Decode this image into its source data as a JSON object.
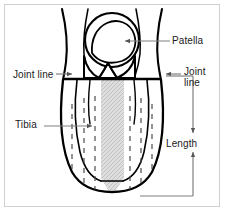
{
  "figure": {
    "type": "anatomical-line-diagram",
    "frame_color": "#cfcfcf",
    "background_color": "#ffffff",
    "line_color": "#000000",
    "leader_color": "#808080",
    "shaded_band_color": "#d6d6d6",
    "dashed_line_color": "#555555"
  },
  "labels": {
    "patella": "Patella",
    "joint_line_left": "Joint line",
    "joint_line_right": "Joint\nline",
    "joint_line_right_l1": "Joint",
    "joint_line_right_l2": "line",
    "tibia": "Tibia",
    "length": "Length"
  },
  "annotations": [
    {
      "name": "patella",
      "text": "Patella",
      "side": "right",
      "leader": "horizontal-line-with-arrow",
      "points_to": "patella-circle"
    },
    {
      "name": "joint-line-left",
      "text": "Joint line",
      "side": "left",
      "leader": "horizontal-line-with-arrow",
      "points_to": "left-knee-joint-margin"
    },
    {
      "name": "joint-line-right",
      "text": "Joint line",
      "side": "right",
      "leader": "horizontal-line-with-arrow",
      "points_to": "right-knee-joint-margin"
    },
    {
      "name": "tibia",
      "text": "Tibia",
      "side": "left",
      "leader": "horizontal-line-with-arrow",
      "points_to": "tibia-shaft"
    },
    {
      "name": "length",
      "text": "Length",
      "side": "right",
      "leader": "vertical-double-headed-dimension-arrow",
      "measures": "joint-line-to-distal-leg"
    }
  ],
  "structures": [
    {
      "name": "patella-circle",
      "shape": "circle"
    },
    {
      "name": "femoral-condyles",
      "shape": "butterfly"
    },
    {
      "name": "tibia-outline",
      "shape": "dashed-vertical-lines"
    },
    {
      "name": "central-shaded-band",
      "shape": "hatched-strip"
    },
    {
      "name": "leg-outline",
      "shape": "tapered-rounded"
    }
  ]
}
